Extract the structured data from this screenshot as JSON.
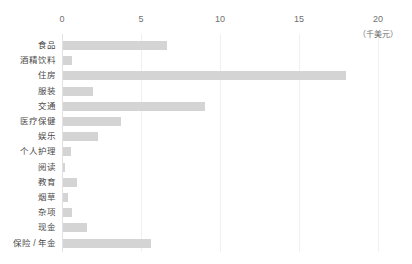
{
  "chart_data": {
    "type": "bar",
    "orientation": "horizontal",
    "title": "",
    "subtitle": "",
    "xlabel": "",
    "ylabel": "",
    "unit_note": "（千美元）",
    "xlim": [
      0,
      20
    ],
    "xticks": [
      0,
      5,
      10,
      15,
      20
    ],
    "xtick_labels": [
      "0",
      "5",
      "10",
      "15",
      "20"
    ],
    "grid": true,
    "grid_axis": "x",
    "legend": false,
    "bar_color": "#d4d4d4",
    "categories": [
      "食品",
      "酒精饮料",
      "住房",
      "服装",
      "交通",
      "医疗保健",
      "娱乐",
      "个人护理",
      "阅读",
      "教育",
      "烟草",
      "杂项",
      "现金",
      "保险 / 年金"
    ],
    "values": [
      6.6,
      0.6,
      17.9,
      1.9,
      9.0,
      3.7,
      2.2,
      0.5,
      0.1,
      0.9,
      0.3,
      0.6,
      1.5,
      5.6
    ]
  },
  "colors": {
    "bar": "#d4d4d4",
    "gridline": "#f0f0f0",
    "axis": "#e2e2e2",
    "tick_text": "#6f6f6f",
    "category_text": "#4a4a4a",
    "background": "#ffffff"
  }
}
